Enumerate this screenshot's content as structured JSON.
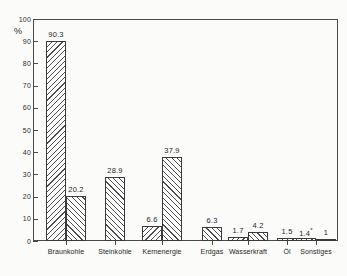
{
  "chart_data": {
    "type": "bar",
    "title": "",
    "subtitle": "",
    "xlabel": "",
    "ylabel": "%",
    "ylim": [
      0,
      100
    ],
    "grid": false,
    "legend": "none",
    "categories": [
      "Braunkohle",
      "Steinkohle",
      "Kernenergie",
      "Erdgas",
      "Wasserkraft",
      "Öl",
      "Sonstiges"
    ],
    "y_ticks": [
      "0",
      "10",
      "20",
      "30",
      "40",
      "50",
      "60",
      "70",
      "80",
      "90",
      "100"
    ],
    "series": [
      {
        "name": "series-1",
        "hatch": "backslash",
        "values": [
          90.3,
          28.9,
          6.6,
          6.3,
          1.7,
          1.5,
          1.4
        ]
      },
      {
        "name": "series-2",
        "hatch": "slash",
        "values": [
          20.2,
          null,
          37.9,
          null,
          4.2,
          null,
          1
        ]
      }
    ],
    "bars": [
      {
        "group": "Braunkohle",
        "series": 1,
        "value": 90.3,
        "label": "90.3",
        "footnote": "",
        "hatch": "backslash"
      },
      {
        "group": "Braunkohle",
        "series": 2,
        "value": 20.2,
        "label": "20.2",
        "footnote": "",
        "hatch": "slash"
      },
      {
        "group": "Steinkohle",
        "series": 1,
        "value": 28.9,
        "label": "28.9",
        "footnote": "",
        "hatch": "slash"
      },
      {
        "group": "Kernenergie",
        "series": 1,
        "value": 6.6,
        "label": "6.6",
        "footnote": "",
        "hatch": "backslash"
      },
      {
        "group": "Kernenergie",
        "series": 2,
        "value": 37.9,
        "label": "37.9",
        "footnote": "",
        "hatch": "slash"
      },
      {
        "group": "Erdgas",
        "series": 1,
        "value": 6.3,
        "label": "6.3",
        "footnote": "",
        "hatch": "slash"
      },
      {
        "group": "Wasserkraft",
        "series": 1,
        "value": 1.7,
        "label": "1.7",
        "footnote": "",
        "hatch": "backslash"
      },
      {
        "group": "Wasserkraft",
        "series": 2,
        "value": 4.2,
        "label": "4.2",
        "footnote": "",
        "hatch": "slash"
      },
      {
        "group": "Öl",
        "series": 1,
        "value": 1.5,
        "label": "1.5",
        "footnote": "",
        "hatch": "slash"
      },
      {
        "group": "Sonstiges",
        "series": 1,
        "value": 1.4,
        "label": "1.4",
        "footnote": "*",
        "hatch": "backslash"
      },
      {
        "group": "Sonstiges",
        "series": 2,
        "value": 1.0,
        "label": "1",
        "footnote": "",
        "hatch": "slash"
      }
    ]
  },
  "axis": {
    "y_unit": "%",
    "y_labels": [
      "100",
      "90",
      "80",
      "70",
      "60",
      "50",
      "40",
      "30",
      "20",
      "10",
      "0"
    ],
    "x_labels": [
      "Braunkohle",
      "Steinkohle",
      "Kernenergie",
      "Erdgas",
      "Wasserkraft",
      "Öl",
      "Sonstiges"
    ]
  },
  "colors": {
    "background": "#fbfbfa",
    "axis": "#4a4a4a",
    "bar_outline": "#3a3a3a",
    "bar_hatch": "#4d4d4d",
    "text": "#1f1f1f"
  }
}
